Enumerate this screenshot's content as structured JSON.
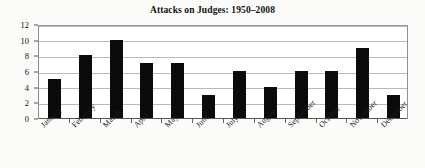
{
  "chart_data": {
    "type": "bar",
    "title": "Attacks on Judges: 1950–2008",
    "xlabel": "",
    "ylabel": "",
    "categories": [
      "January",
      "February",
      "March",
      "April",
      "May",
      "June",
      "July",
      "August",
      "September",
      "October",
      "November",
      "December"
    ],
    "values": [
      5,
      8,
      10,
      7,
      7,
      3,
      6,
      4,
      6,
      6,
      9,
      3
    ],
    "ylim": [
      0,
      12
    ],
    "ytick_labels": [
      "0",
      "2",
      "4",
      "6",
      "8",
      "10",
      "12"
    ],
    "ytick_values": [
      0,
      2,
      4,
      6,
      8,
      10,
      12
    ],
    "grid": true,
    "legend": "none",
    "bar_color": "#0b0b0b",
    "gridline_color": "#b9b9b9",
    "axis_color": "#555555",
    "background_color": "#ffffff",
    "series": [
      {
        "name": "Attacks on Judges",
        "values": [
          5,
          8,
          10,
          7,
          7,
          3,
          6,
          4,
          6,
          6,
          9,
          3
        ]
      }
    ]
  }
}
